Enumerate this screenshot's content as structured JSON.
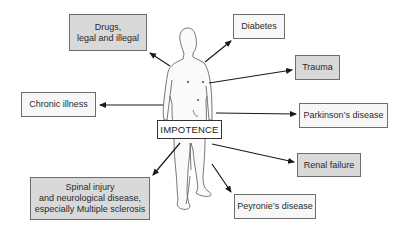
{
  "diagram": {
    "center": {
      "label": "IMPOTENCE"
    },
    "causes": [
      {
        "id": "drugs",
        "label": "Drugs,\nlegal and illegal",
        "shaded": true
      },
      {
        "id": "diabetes",
        "label": "Diabetes",
        "shaded": false
      },
      {
        "id": "trauma",
        "label": "Trauma",
        "shaded": true
      },
      {
        "id": "chronic",
        "label": "Chronic illness",
        "shaded": false
      },
      {
        "id": "parkinsons",
        "label": "Parkinson’s disease",
        "shaded": false
      },
      {
        "id": "renal",
        "label": "Renal failure",
        "shaded": true
      },
      {
        "id": "spinal",
        "label": "Spinal injury\nand neurological disease,\nespecially Multiple sclerosis",
        "shaded": true
      },
      {
        "id": "peyronies",
        "label": "Peyronie’s disease",
        "shaded": false
      }
    ],
    "colors": {
      "shaded_box": "#d9d9d9",
      "plain_box": "#f7f7f7",
      "border": "#6d6d6d",
      "arrow": "#1a1a1a",
      "figure_outline": "#555555"
    }
  }
}
